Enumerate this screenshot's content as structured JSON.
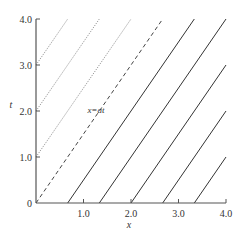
{
  "chart_data": {
    "type": "line",
    "title": "",
    "xlabel": "x",
    "ylabel": "t",
    "xlim": [
      0,
      4.0
    ],
    "ylim": [
      0,
      4.0
    ],
    "x_ticks": [
      "1.0",
      "2.0",
      "3.0",
      "4.0"
    ],
    "y_ticks": [
      "0",
      "1.0",
      "2.0",
      "3.0",
      "4.0"
    ],
    "grid": false,
    "legend": null,
    "annotations": [
      {
        "text": "x=at",
        "x": 1.25,
        "t": 1.95
      }
    ],
    "slope_a": 0.667,
    "series": [
      {
        "name": "dotted-t3",
        "style": "dotted",
        "points": [
          [
            0,
            3.0
          ],
          [
            0.667,
            4.0
          ]
        ]
      },
      {
        "name": "dotted-t2",
        "style": "dotted",
        "points": [
          [
            0,
            2.0
          ],
          [
            1.333,
            4.0
          ]
        ]
      },
      {
        "name": "dotted-t1",
        "style": "dotted",
        "points": [
          [
            0,
            1.0
          ],
          [
            2.0,
            4.0
          ]
        ]
      },
      {
        "name": "x=at",
        "style": "dashed",
        "points": [
          [
            0,
            0
          ],
          [
            2.667,
            4.0
          ]
        ]
      },
      {
        "name": "solid-x0.67",
        "style": "solid",
        "points": [
          [
            0.667,
            0
          ],
          [
            3.333,
            4.0
          ]
        ]
      },
      {
        "name": "solid-x1.33",
        "style": "solid",
        "points": [
          [
            1.333,
            0
          ],
          [
            4.0,
            4.0
          ]
        ]
      },
      {
        "name": "solid-x2.0",
        "style": "solid",
        "points": [
          [
            2.0,
            0
          ],
          [
            4.0,
            3.0
          ]
        ]
      },
      {
        "name": "solid-x2.67",
        "style": "solid",
        "points": [
          [
            2.667,
            0
          ],
          [
            4.0,
            2.0
          ]
        ]
      },
      {
        "name": "solid-x3.33",
        "style": "solid",
        "points": [
          [
            3.333,
            0
          ],
          [
            4.0,
            1.0
          ]
        ]
      }
    ]
  },
  "axes": {
    "x_label": "x",
    "y_label": "t",
    "annotation": "x=at",
    "origin_label": "0"
  }
}
